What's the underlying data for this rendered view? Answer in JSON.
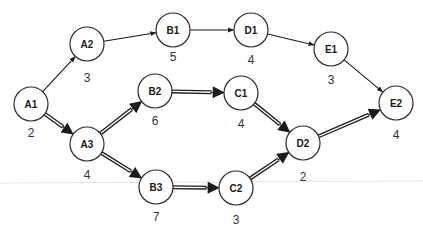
{
  "diagram": {
    "type": "activity-network",
    "nodes": [
      {
        "id": "A1",
        "label": "A1",
        "weight": "2"
      },
      {
        "id": "A2",
        "label": "A2",
        "weight": "3"
      },
      {
        "id": "A3",
        "label": "A3",
        "weight": "4"
      },
      {
        "id": "B1",
        "label": "B1",
        "weight": "5"
      },
      {
        "id": "B2",
        "label": "B2",
        "weight": "6"
      },
      {
        "id": "B3",
        "label": "B3",
        "weight": "7"
      },
      {
        "id": "C1",
        "label": "C1",
        "weight": "4"
      },
      {
        "id": "C2",
        "label": "C2",
        "weight": "3"
      },
      {
        "id": "D1",
        "label": "D1",
        "weight": "4"
      },
      {
        "id": "D2",
        "label": "D2",
        "weight": "2"
      },
      {
        "id": "E1",
        "label": "E1",
        "weight": "3"
      },
      {
        "id": "E2",
        "label": "E2",
        "weight": "4"
      }
    ],
    "edges": [
      {
        "from": "A1",
        "to": "A2",
        "style": "single"
      },
      {
        "from": "A2",
        "to": "B1",
        "style": "single"
      },
      {
        "from": "B1",
        "to": "D1",
        "style": "single"
      },
      {
        "from": "D1",
        "to": "E1",
        "style": "single"
      },
      {
        "from": "E1",
        "to": "E2",
        "style": "single"
      },
      {
        "from": "A1",
        "to": "A3",
        "style": "double"
      },
      {
        "from": "A3",
        "to": "B2",
        "style": "double"
      },
      {
        "from": "A3",
        "to": "B3",
        "style": "double"
      },
      {
        "from": "B2",
        "to": "C1",
        "style": "double"
      },
      {
        "from": "B3",
        "to": "C2",
        "style": "double"
      },
      {
        "from": "C1",
        "to": "D2",
        "style": "double"
      },
      {
        "from": "C2",
        "to": "D2",
        "style": "double"
      },
      {
        "from": "D2",
        "to": "E2",
        "style": "double"
      }
    ],
    "colors": {
      "node_stroke": "#2a2a2a",
      "edge": "#1a1a1a",
      "background": "#ffffff"
    }
  }
}
